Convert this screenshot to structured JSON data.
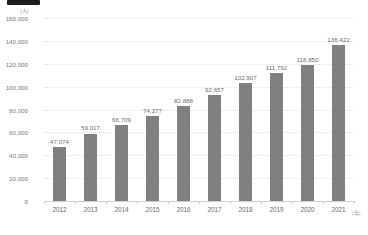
{
  "chart_data": {
    "type": "bar",
    "title": "",
    "subtitle": "",
    "xlabel": "(年)",
    "ylabel": "(人)",
    "categories": [
      "2012",
      "2013",
      "2014",
      "2015",
      "2016",
      "2017",
      "2018",
      "2019",
      "2020",
      "2021"
    ],
    "values": [
      47074,
      59017,
      66709,
      74277,
      82888,
      92657,
      102907,
      111792,
      118850,
      136422
    ],
    "value_labels": [
      "47,074",
      "59,017",
      "66,709",
      "74,277",
      "82,888",
      "92,657",
      "102,907",
      "111,792",
      "118,850",
      "136,422"
    ],
    "ylim": [
      0,
      160000
    ],
    "ytick_values": [
      0,
      20000,
      40000,
      60000,
      80000,
      100000,
      120000,
      140000,
      160000
    ],
    "ytick_labels": [
      "0",
      "20,000",
      "40,000",
      "60,000",
      "80,000",
      "100,000",
      "120,000",
      "140,000",
      "160,000"
    ],
    "grid": true,
    "grid_orientation": "horizontal",
    "legend": false,
    "legend_position": "none",
    "series": [
      {
        "name": "",
        "values": [
          47074,
          59017,
          66709,
          74277,
          82888,
          92657,
          102907,
          111792,
          118850,
          136422
        ],
        "color": "#808080"
      }
    ],
    "colors": {
      "bar": "#808080",
      "gridline": "#e2e2e2",
      "axis": "#cfcfcf",
      "tick_text": "#7a7a7a",
      "value_text": "#6e6e6e",
      "unit_text": "#9a9a9a",
      "redaction": "#1d1d1d"
    }
  },
  "overlay": {
    "redaction_label": "redacted-title-block"
  }
}
